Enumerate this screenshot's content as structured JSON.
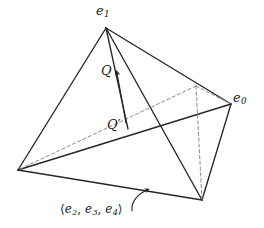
{
  "figure": {
    "type": "geometric-line-diagram",
    "shape": "tetrahedron",
    "background_color": "#ffffff",
    "line_color": "#262626",
    "dashed_line_color": "#8a8a8a",
    "text_color": "#1a1a1a"
  },
  "labels": {
    "apex": {
      "base": "e",
      "subscript": "1",
      "full": "e1"
    },
    "right_vertex": {
      "base": "e",
      "subscript": "0",
      "full": "e0"
    },
    "point_q": {
      "full": "Q"
    },
    "point_q_prime": {
      "base": "Q",
      "prime": "′",
      "full": "Q′"
    },
    "bottom_face": {
      "open": "⟨",
      "close": "⟩",
      "items": [
        {
          "base": "e",
          "subscript": "2"
        },
        {
          "base": "e",
          "subscript": "3"
        },
        {
          "base": "e",
          "subscript": "4"
        }
      ],
      "separator": ", ",
      "full": "⟨e2, e3, e4⟩"
    }
  },
  "vertices": {
    "apex": {
      "name": "e1",
      "x": 106,
      "y": 28
    },
    "left": {
      "name": "left-vertex",
      "x": 18,
      "y": 170
    },
    "right": {
      "name": "e0",
      "x": 231,
      "y": 104
    },
    "bottom_right": {
      "name": "bottom-right-vertex",
      "x": 202,
      "y": 200
    },
    "back_hidden": {
      "name": "back-hidden-vertex",
      "x": 196,
      "y": 86
    }
  },
  "annotations": {
    "q_arrow": {
      "name": "q-direction-arrow",
      "from_x": 128,
      "from_y": 128,
      "to_x": 117,
      "to_y": 72,
      "direction": "up"
    },
    "face_pointer": {
      "name": "bottom-face-curved-pointer",
      "from_x": 133,
      "from_y": 209,
      "to_x": 147,
      "to_y": 191,
      "direction": "up-right"
    }
  }
}
